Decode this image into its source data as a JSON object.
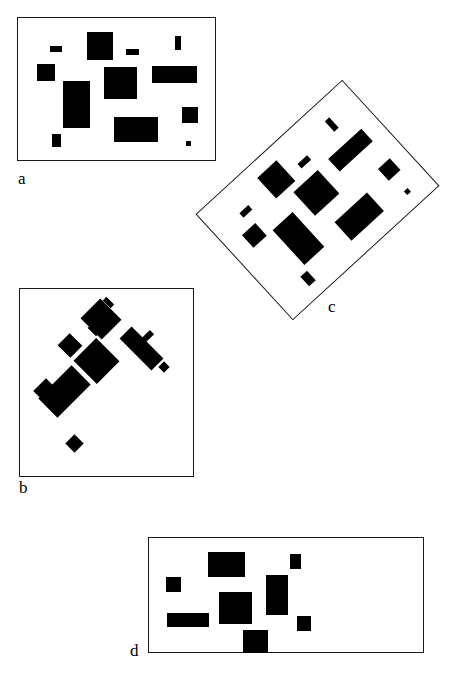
{
  "figure": {
    "caption_labels": [
      "a",
      "b",
      "c",
      "d"
    ],
    "background_color": "#ffffff",
    "rect_fill_color": "#000000",
    "frame_color": "#1a1a1a",
    "canvas": {
      "width": 449,
      "height": 682
    }
  },
  "panels": [
    {
      "id": "a",
      "label": "a",
      "label_position": {
        "x": 18,
        "y": 170
      },
      "frame": {
        "x": 17,
        "y": 17,
        "width": 199,
        "height": 144
      },
      "rotation_deg": 0,
      "rect_rotation_deg": 0,
      "rect_count": 11,
      "rects": [
        {
          "name": "rect-1",
          "x": 50,
          "y": 46,
          "width": 12,
          "height": 6
        },
        {
          "name": "rect-2",
          "x": 87,
          "y": 32,
          "width": 26,
          "height": 28
        },
        {
          "name": "rect-3",
          "x": 126,
          "y": 49,
          "width": 13,
          "height": 6
        },
        {
          "name": "rect-4",
          "x": 175,
          "y": 36,
          "width": 6,
          "height": 14
        },
        {
          "name": "rect-5",
          "x": 37,
          "y": 64,
          "width": 18,
          "height": 17
        },
        {
          "name": "rect-6",
          "x": 104,
          "y": 67,
          "width": 33,
          "height": 32
        },
        {
          "name": "rect-7",
          "x": 152,
          "y": 66,
          "width": 45,
          "height": 17
        },
        {
          "name": "rect-8",
          "x": 63,
          "y": 81,
          "width": 27,
          "height": 47
        },
        {
          "name": "rect-9",
          "x": 182,
          "y": 107,
          "width": 16,
          "height": 16
        },
        {
          "name": "rect-10",
          "x": 114,
          "y": 117,
          "width": 44,
          "height": 25
        },
        {
          "name": "rect-11",
          "x": 52,
          "y": 134,
          "width": 9,
          "height": 13
        },
        {
          "name": "rect-12",
          "x": 186,
          "y": 141,
          "width": 5,
          "height": 5
        }
      ]
    },
    {
      "id": "b",
      "label": "b",
      "label_position": {
        "x": 19,
        "y": 479
      },
      "frame": {
        "x": 19,
        "y": 288,
        "width": 175,
        "height": 189
      },
      "rotation_deg": 0,
      "rect_rotation_deg": 45,
      "rect_count": 11,
      "rects": [
        {
          "name": "rect-1",
          "x": 103,
          "y": 300,
          "width": 11,
          "height": 5
        },
        {
          "name": "rect-2",
          "x": 86,
          "y": 305,
          "width": 30,
          "height": 28
        },
        {
          "name": "rect-3",
          "x": 88,
          "y": 327,
          "width": 12,
          "height": 6
        },
        {
          "name": "rect-4",
          "x": 144,
          "y": 330,
          "width": 6,
          "height": 14
        },
        {
          "name": "rect-5",
          "x": 61,
          "y": 337,
          "width": 18,
          "height": 17
        },
        {
          "name": "rect-6",
          "x": 80,
          "y": 345,
          "width": 33,
          "height": 32
        },
        {
          "name": "rect-7",
          "x": 119,
          "y": 340,
          "width": 45,
          "height": 17
        },
        {
          "name": "rect-8",
          "x": 51,
          "y": 368,
          "width": 27,
          "height": 47
        },
        {
          "name": "rect-9",
          "x": 160,
          "y": 363,
          "width": 8,
          "height": 8
        },
        {
          "name": "rect-10",
          "x": 37,
          "y": 382,
          "width": 18,
          "height": 18
        },
        {
          "name": "rect-11",
          "x": 68,
          "y": 437,
          "width": 13,
          "height": 13
        }
      ]
    },
    {
      "id": "c",
      "label": "c",
      "label_position": {
        "x": 328,
        "y": 298
      },
      "frame": {
        "x": 218,
        "y": 128,
        "width": 199,
        "height": 144
      },
      "rotation_deg": -42.5,
      "rect_rotation_deg": -42.5,
      "rect_count": 11,
      "corners": {
        "top": {
          "x": 342,
          "y": 85
        },
        "right": {
          "x": 437,
          "y": 192
        },
        "bottom": {
          "x": 292,
          "y": 328
        },
        "left": {
          "x": 196,
          "y": 220
        }
      },
      "note": "panel a rotated counter-clockwise"
    },
    {
      "id": "d",
      "label": "d",
      "label_position": {
        "x": 130,
        "y": 642
      },
      "frame": {
        "x": 148,
        "y": 537,
        "width": 276,
        "height": 116
      },
      "rotation_deg": 0,
      "rect_rotation_deg": 0,
      "rect_count": 8,
      "rects": [
        {
          "name": "rect-1",
          "x": 208,
          "y": 552,
          "width": 37,
          "height": 25
        },
        {
          "name": "rect-2",
          "x": 290,
          "y": 554,
          "width": 11,
          "height": 15
        },
        {
          "name": "rect-3",
          "x": 166,
          "y": 577,
          "width": 15,
          "height": 15
        },
        {
          "name": "rect-4",
          "x": 266,
          "y": 575,
          "width": 22,
          "height": 40
        },
        {
          "name": "rect-5",
          "x": 219,
          "y": 592,
          "width": 33,
          "height": 32
        },
        {
          "name": "rect-6",
          "x": 167,
          "y": 613,
          "width": 42,
          "height": 14
        },
        {
          "name": "rect-7",
          "x": 297,
          "y": 616,
          "width": 14,
          "height": 15
        },
        {
          "name": "rect-8",
          "x": 243,
          "y": 630,
          "width": 25,
          "height": 23
        }
      ]
    }
  ]
}
